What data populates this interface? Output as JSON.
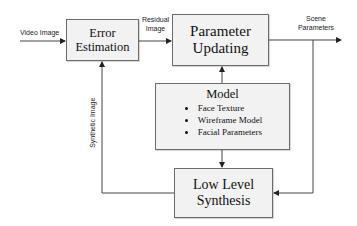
{
  "diagram": {
    "type": "block-flow",
    "colors": {
      "box_fill": "#f2f2f2",
      "box_border": "#6b6b6b",
      "line": "#333333"
    },
    "blocks": {
      "error_estimation": {
        "line1": "Error",
        "line2": "Estimation"
      },
      "parameter_updating": {
        "line1": "Parameter",
        "line2": "Updating"
      },
      "model": {
        "title": "Model",
        "items": [
          "Face Texture",
          "Wireframe Model",
          "Facial Parameters"
        ]
      },
      "low_level_synthesis": {
        "line1": "Low Level",
        "line2": "Synthesis"
      }
    },
    "edge_labels": {
      "video_image": "Video Image",
      "residual_line1": "Residual",
      "residual_line2": "Image",
      "scene_line1": "Scene",
      "scene_line2": "Parameters",
      "synthetic_image": "Synthetic Image"
    },
    "edges": [
      {
        "from": "input",
        "to": "Error Estimation",
        "label": "Video Image"
      },
      {
        "from": "Error Estimation",
        "to": "Parameter Updating",
        "label": "Residual Image"
      },
      {
        "from": "Parameter Updating",
        "to": "output",
        "label": "Scene Parameters"
      },
      {
        "from": "Parameter Updating",
        "to": "Low Level Synthesis",
        "label": "Scene Parameters"
      },
      {
        "from": "Model",
        "to": "Parameter Updating",
        "label": ""
      },
      {
        "from": "Model",
        "to": "Low Level Synthesis",
        "label": ""
      },
      {
        "from": "Low Level Synthesis",
        "to": "Error Estimation",
        "label": "Synthetic Image"
      }
    ]
  }
}
